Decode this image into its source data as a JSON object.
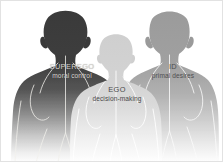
{
  "diagram": {
    "background_color": "#ffffff",
    "border_color": "#e2e2e2",
    "figures": [
      {
        "id": "superego",
        "label": "SUPEREGO",
        "sublabel": "moral control",
        "position": "left",
        "fill_color": "#3b3b3b",
        "text_color": "#d8d6d2"
      },
      {
        "id": "ego",
        "label": "EGO",
        "sublabel": "decision-making",
        "position": "center",
        "fill_color": "#cfcfcf",
        "text_color": "#4a4a4a"
      },
      {
        "id": "id",
        "label": "ID",
        "sublabel": "primal desires",
        "position": "right",
        "fill_color": "#9a9a9a",
        "text_color": "#4f4f4f"
      }
    ]
  }
}
